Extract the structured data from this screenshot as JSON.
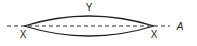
{
  "diagram": {
    "labels": {
      "top": "Y",
      "left_point": "X",
      "right_point": "X",
      "axis": "A"
    },
    "colors": {
      "stroke": "#222222",
      "background": "#ffffff"
    }
  }
}
